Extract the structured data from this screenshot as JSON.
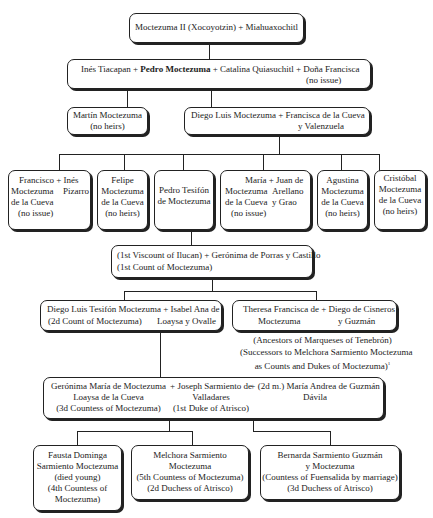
{
  "nodes": {
    "root": "Moctezuma II (Xocoyotzin) + Miahuaxochitl",
    "gen2": {
      "a": "Inés Tiacapan + ",
      "b": "Pedro Moctezuma",
      "c": " + Catalina Quiasuchitl + Doña Francisca",
      "d": "(no issue)"
    },
    "martin": {
      "l1": "Martín Moctezuma",
      "l2": "(no heirs)"
    },
    "diego": {
      "l1": "Diego Luis Moctezuma  + Francisca de la Cueva",
      "l2": "y Valenzuela"
    },
    "francisco": {
      "a1": "Francisco + Inés",
      "a2": "Moctezuma",
      "b2": "Pizarro",
      "a3": "de la Cueva",
      "a4": "(no issue)"
    },
    "felipe": {
      "l1": "Felipe",
      "l2": "Moctezuma",
      "l3": "de la Cueva",
      "l4": "(no heirs)"
    },
    "pedro_t": {
      "l1": "Pedro Tesifón",
      "l2": "de Moctezuma"
    },
    "maria": {
      "a1": "María + Juan de",
      "a2": "Moctezuma",
      "b2": "Arellano",
      "a3": "de la Cueva",
      "b3": "y Grao",
      "a4": "(no issue)"
    },
    "agustina": {
      "l1": "Agustina",
      "l2": "Moctezuma",
      "l3": "de la Cueva",
      "l4": "(no heirs)"
    },
    "cristobal": {
      "l1": "Cristóbal",
      "l2": "Moctezuma",
      "l3": "de la Cueva",
      "l4": "(no heirs)"
    },
    "viscount": {
      "l1": "(1st Viscount of Ilucan) + Gerónima de Porras y Castillo",
      "l2": "(1st Count of Moctezuma)"
    },
    "diego_t": {
      "a1": "Diego Luis Tesifón Moctezuma + Isabel Ana de",
      "a2": "(2d Count of Moctezuma)",
      "b2": "Loaysa y Ovalle"
    },
    "theresa": {
      "a1": "Theresa Francisca de  + Diego de Cisneros",
      "a2": "Moctezuma",
      "b2": "y Guzmán"
    },
    "theresa_note": {
      "l1": "(Ancestors of Marqueses of Tenebrón)",
      "l2": "(Successors to Melchora Sarmiento Moctezuma",
      "l3": "as Counts and Dukes of Moctezuma)",
      "sup": "1"
    },
    "geronima": {
      "a1": "Gerónima María de Moctezuma",
      "a2": "Loaysa de la Cueva",
      "a3": "(3d Countess of Moctezuma)",
      "b1": "+ Joseph Sarmiento de",
      "b2": "Valladares",
      "b3": "(1st Duke of Atrisco)",
      "c1": "+ (2d m.) María Andrea de Guzmán",
      "c2": "Dávila"
    },
    "fausta": {
      "l1": "Fausta Dominga",
      "l2": "Sarmiento Moctezuma",
      "l3": "(died young)",
      "l4": "(4th Countess of",
      "l5": "Moctezuma)"
    },
    "melchora": {
      "l1": "Melchora Sarmiento",
      "l2": "Moctezuma",
      "l3": "(5th Countess of Moctezuma)",
      "l4": "(2d Duchess of Atrisco)"
    },
    "bernarda": {
      "l1": "Bernarda Sarmiento Guzmán",
      "l2": "y Moctezuma",
      "l3": "(Countess of Fuensalida by marriage)",
      "l4": "(3d Duchess of Atrisco)"
    }
  }
}
